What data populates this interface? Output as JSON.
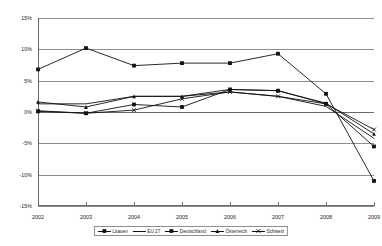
{
  "chart_data": {
    "type": "line",
    "title": "",
    "subtitle": "",
    "xlabel": "",
    "ylabel": "",
    "categories": [
      "2002",
      "2003",
      "2004",
      "2005",
      "2006",
      "2007",
      "2008",
      "2009"
    ],
    "x": [
      2002,
      2003,
      2004,
      2005,
      2006,
      2007,
      2008,
      2009
    ],
    "ylim": [
      -15,
      15
    ],
    "ytick_values": [
      15,
      10,
      5,
      0,
      -5,
      -10,
      -15
    ],
    "ytick_labels": [
      "15%",
      "10%",
      "5%",
      "0%",
      "-5%",
      "-10%",
      "-15%"
    ],
    "grid": true,
    "legend_position": "bottom",
    "value_unit": "%",
    "series": [
      {
        "name": "Litauen",
        "marker": "square",
        "values": [
          6.8,
          10.2,
          7.4,
          7.8,
          7.8,
          9.3,
          2.9,
          -11.0
        ]
      },
      {
        "name": "EU 27",
        "marker": "none",
        "values": [
          1.3,
          1.3,
          2.5,
          2.5,
          3.2,
          2.5,
          0.9,
          -4.2
        ]
      },
      {
        "name": "Deutschland",
        "marker": "square",
        "values": [
          0.1,
          -0.2,
          1.2,
          0.8,
          3.6,
          3.4,
          1.3,
          -5.5
        ]
      },
      {
        "name": "Österreich",
        "marker": "triangle",
        "values": [
          1.6,
          0.8,
          2.5,
          2.5,
          3.6,
          3.4,
          1.4,
          -3.5
        ]
      },
      {
        "name": "Schweiz",
        "marker": "cross",
        "values": [
          0.2,
          -0.2,
          0.3,
          2.1,
          3.2,
          2.5,
          1.3,
          -2.8
        ]
      }
    ]
  },
  "legend": {
    "items": [
      {
        "label": "Litauen"
      },
      {
        "label": "EU 27"
      },
      {
        "label": "Deutschland"
      },
      {
        "label": "Österreich"
      },
      {
        "label": "Schweiz"
      }
    ]
  }
}
